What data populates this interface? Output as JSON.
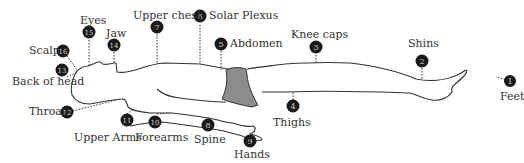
{
  "diagram": {
    "type": "body-scan-points",
    "colors": {
      "outline": "#333333",
      "marker_fill": "#1a1a1a",
      "marker_text": "#cccccc",
      "shorts_fill": "#8c8c8c",
      "label_text": "#333333"
    },
    "points": [
      {
        "num": "1",
        "label": "Feet"
      },
      {
        "num": "2",
        "label": "Shins"
      },
      {
        "num": "3",
        "label": "Knee caps"
      },
      {
        "num": "4",
        "label": "Thighs"
      },
      {
        "num": "5",
        "label": "Abdomen"
      },
      {
        "num": "6",
        "label": "Solar Plexus"
      },
      {
        "num": "7",
        "label": "Upper chest"
      },
      {
        "num": "8",
        "label": "Spine"
      },
      {
        "num": "9",
        "label": "Hands"
      },
      {
        "num": "10",
        "label": "Forearms"
      },
      {
        "num": "11",
        "label": "Upper Arms"
      },
      {
        "num": "12",
        "label": "Throat"
      },
      {
        "num": "13",
        "label": "Back of head"
      },
      {
        "num": "14",
        "label": "Jaw"
      },
      {
        "num": "15",
        "label": "Eyes"
      },
      {
        "num": "16",
        "label": "Scalp"
      }
    ]
  }
}
